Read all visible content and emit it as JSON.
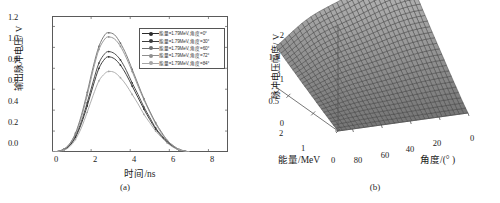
{
  "figure": {
    "panels": [
      {
        "caption": "(a)"
      },
      {
        "caption": "(b)"
      }
    ]
  },
  "chart_data": [
    {
      "type": "line",
      "panel_label": "(a)",
      "title": "",
      "xlabel": "时间/ns",
      "ylabel": "输出脉冲电压/ V",
      "xlim": [
        0,
        9
      ],
      "ylim": [
        0,
        1.3
      ],
      "xticks": [
        "0",
        "2",
        "4",
        "6",
        "8"
      ],
      "xtick_values": [
        0,
        2,
        4,
        6,
        8
      ],
      "yticks": [
        "0.0",
        "0.2",
        "0.4",
        "0.6",
        "0.8",
        "1.0",
        "1.2"
      ],
      "ytick_values": [
        0.0,
        0.2,
        0.4,
        0.6,
        0.8,
        1.0,
        1.2
      ],
      "grid": false,
      "legend_position": "upper-right",
      "markers": true,
      "x": [
        0,
        0.3,
        0.6,
        0.9,
        1.2,
        1.5,
        1.8,
        2.1,
        2.4,
        2.7,
        2.9,
        3.2,
        3.5,
        3.8,
        4.1,
        4.4,
        4.7,
        5.0,
        5.3,
        5.6,
        5.9,
        6.2,
        6.5,
        6.8,
        7.0
      ],
      "series": [
        {
          "name": "能量=1.79MeV, 角度=0°",
          "color": "#2b2b2b",
          "peak": 0.91,
          "peak_time": 2.9,
          "values": [
            0.0,
            0.005,
            0.02,
            0.06,
            0.14,
            0.27,
            0.44,
            0.63,
            0.8,
            0.89,
            0.91,
            0.89,
            0.83,
            0.74,
            0.63,
            0.52,
            0.41,
            0.31,
            0.22,
            0.15,
            0.09,
            0.05,
            0.02,
            0.008,
            0.0
          ]
        },
        {
          "name": "能量=1.79MeV, 角度=30°",
          "color": "#3d3d3d",
          "peak": 0.96,
          "peak_time": 2.9,
          "values": [
            0.0,
            0.006,
            0.022,
            0.065,
            0.15,
            0.29,
            0.47,
            0.67,
            0.85,
            0.94,
            0.96,
            0.94,
            0.88,
            0.78,
            0.66,
            0.55,
            0.43,
            0.33,
            0.23,
            0.16,
            0.1,
            0.05,
            0.02,
            0.008,
            0.0
          ]
        },
        {
          "name": "能量=1.79MeV, 角度=60°",
          "color": "#6e6e6e",
          "peak": 1.14,
          "peak_time": 2.9,
          "values": [
            0.0,
            0.007,
            0.027,
            0.078,
            0.18,
            0.35,
            0.57,
            0.81,
            1.01,
            1.12,
            1.14,
            1.12,
            1.04,
            0.93,
            0.79,
            0.65,
            0.51,
            0.39,
            0.28,
            0.19,
            0.11,
            0.06,
            0.025,
            0.01,
            0.0
          ]
        },
        {
          "name": "能量=1.79MeV, 角度=72°",
          "color": "#8f8f8f",
          "peak": 1.1,
          "peak_time": 2.95,
          "values": [
            0.0,
            0.007,
            0.026,
            0.075,
            0.17,
            0.33,
            0.54,
            0.78,
            0.98,
            1.08,
            1.1,
            1.08,
            1.01,
            0.9,
            0.77,
            0.63,
            0.5,
            0.38,
            0.27,
            0.18,
            0.11,
            0.06,
            0.024,
            0.01,
            0.0
          ]
        },
        {
          "name": "能量=1.79MeV, 角度=84°",
          "color": "#a6a6a6",
          "peak": 0.77,
          "peak_time": 2.95,
          "values": [
            0.0,
            0.004,
            0.016,
            0.05,
            0.12,
            0.23,
            0.38,
            0.54,
            0.68,
            0.75,
            0.77,
            0.76,
            0.71,
            0.64,
            0.55,
            0.46,
            0.36,
            0.28,
            0.2,
            0.14,
            0.085,
            0.045,
            0.02,
            0.007,
            0.0
          ]
        }
      ]
    },
    {
      "type": "surface",
      "panel_label": "(b)",
      "title": "",
      "xlabel": "能量/MeV",
      "ylabel": "角度/(° )",
      "zlabel": "脉冲电压幅度/ V",
      "xlim": [
        0,
        2.5
      ],
      "ylim": [
        0,
        90
      ],
      "zlim": [
        0,
        2
      ],
      "xticks": [
        "0",
        "1",
        "2"
      ],
      "xtick_values": [
        0,
        1,
        2
      ],
      "yticks": [
        "0",
        "20",
        "40",
        "60",
        "80"
      ],
      "ytick_values": [
        0,
        20,
        40,
        60,
        80
      ],
      "zticks": [
        "0",
        "0.5",
        "1",
        "1.5",
        "2"
      ],
      "ztick_values": [
        0,
        0.5,
        1,
        1.5,
        2
      ],
      "grid": true,
      "mesh_color": "#3a3a3a",
      "surface_fill": "#8d8d8d",
      "z_peak": 1.85,
      "z_peak_at": {
        "energy": 2.5,
        "angle": 75
      },
      "note": "脉冲电压幅度随能量增大而升高，随角度减小而升高"
    }
  ]
}
